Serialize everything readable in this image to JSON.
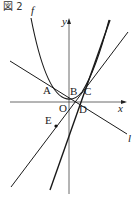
{
  "figure": {
    "title": "図 2",
    "curve_label": "f",
    "axes": {
      "x_label": "x",
      "y_label": "y",
      "origin_label": "O"
    },
    "line_label": "l",
    "points": [
      {
        "name": "A",
        "x": 47,
        "y": 88
      },
      {
        "name": "B",
        "x": 74,
        "y": 96
      },
      {
        "name": "C",
        "x": 85,
        "y": 88
      },
      {
        "name": "D",
        "x": 80,
        "y": 104
      },
      {
        "name": "E",
        "x": 56,
        "y": 125
      }
    ],
    "colors": {
      "stroke": "#1a1a1a",
      "background": "#ffffff"
    }
  }
}
